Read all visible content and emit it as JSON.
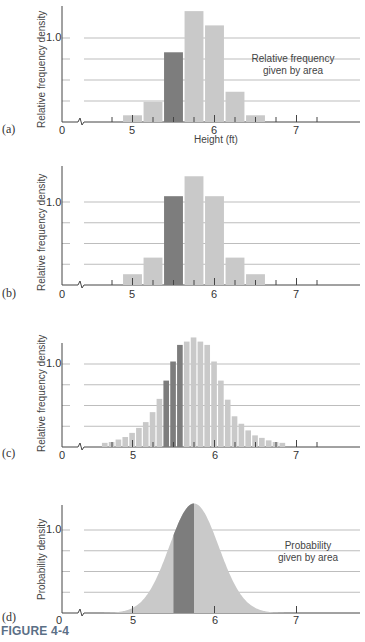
{
  "figure": {
    "caption": "FIGURE 4-4",
    "colors": {
      "bar": "#c9c9c9",
      "bar_highlight": "#7d7d7d",
      "grid": "#bdbdbd",
      "axis": "#444444",
      "caption": "#5b6f86"
    }
  },
  "panels": [
    {
      "label": "(a)",
      "ylabel": "Relative frequency density",
      "y_tick": "1.0",
      "xlabel": "Height (ft)",
      "annotation_line1": "Relative frequency",
      "annotation_line2": "given by area",
      "x_ticks": [
        "0",
        "5",
        "6",
        "7"
      ]
    },
    {
      "label": "(b)",
      "ylabel": "Relative frequency  density",
      "y_tick": "1.0",
      "x_ticks": [
        "0",
        "5",
        "6",
        "7"
      ]
    },
    {
      "label": "(c)",
      "ylabel": "Relative frequency  density",
      "y_tick": "1.0",
      "x_ticks": [
        "0",
        "5",
        "6",
        "7"
      ]
    },
    {
      "label": "(d)",
      "ylabel": "Probability density",
      "y_tick": "1.0",
      "annotation_line1": "Probability",
      "annotation_line2": "given by area",
      "x_ticks": [
        "0",
        "5",
        "6",
        "7"
      ]
    }
  ],
  "chart_data": [
    {
      "type": "bar",
      "title": "(a)",
      "xlabel": "Height (ft)",
      "ylabel": "Relative frequency density",
      "annotation": "Relative frequency given by area",
      "x": [
        5.0,
        5.25,
        5.5,
        5.75,
        6.0,
        6.25,
        6.5
      ],
      "values": [
        0.08,
        0.24,
        0.83,
        1.32,
        1.15,
        0.36,
        0.08
      ],
      "highlighted_bin": 5.5,
      "bin_width": 0.25,
      "x_ticks": [
        0,
        5,
        6,
        7
      ],
      "y_ticks": [
        1.0
      ],
      "axis_break": true,
      "grid": true,
      "ylim": [
        0,
        1.4
      ]
    },
    {
      "type": "bar",
      "title": "(b)",
      "ylabel": "Relative frequency density",
      "x": [
        5.0,
        5.25,
        5.5,
        5.75,
        6.0,
        6.25,
        6.5
      ],
      "values": [
        0.13,
        0.33,
        1.07,
        1.31,
        1.07,
        0.33,
        0.13
      ],
      "highlighted_bin": 5.5,
      "bin_width": 0.25,
      "x_ticks": [
        0,
        5,
        6,
        7
      ],
      "y_ticks": [
        1.0
      ],
      "axis_break": true,
      "grid": true,
      "ylim": [
        0,
        1.4
      ]
    },
    {
      "type": "bar",
      "title": "(c)",
      "ylabel": "Relative frequency density",
      "bin_width": 0.0833,
      "x_start": 4.62,
      "values": [
        0.05,
        0.06,
        0.09,
        0.12,
        0.17,
        0.23,
        0.3,
        0.42,
        0.58,
        0.8,
        1.03,
        1.23,
        1.27,
        1.32,
        1.27,
        1.23,
        1.03,
        0.8,
        0.57,
        0.37,
        0.28,
        0.2,
        0.14,
        0.11,
        0.08,
        0.06,
        0.05
      ],
      "highlighted_indices": [
        9,
        10,
        11
      ],
      "x_ticks": [
        0,
        5,
        6,
        7
      ],
      "y_ticks": [
        1.0
      ],
      "axis_break": true,
      "grid": true,
      "ylim": [
        0,
        1.4
      ]
    },
    {
      "type": "area",
      "title": "(d)",
      "ylabel": "Probability density",
      "annotation": "Probability given by area",
      "distribution": "normal",
      "mean": 5.75,
      "peak_density": 1.32,
      "shaded_interval": [
        5.5,
        5.75
      ],
      "x_ticks": [
        0,
        5,
        6,
        7
      ],
      "y_ticks": [
        1.0
      ],
      "axis_break": true,
      "grid": true,
      "ylim": [
        0,
        1.4
      ]
    }
  ]
}
